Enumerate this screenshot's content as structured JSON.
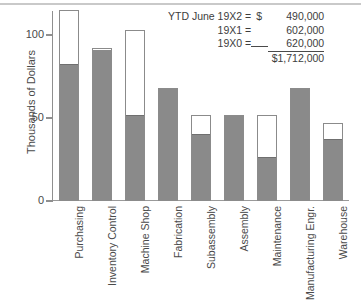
{
  "chart_data": {
    "type": "bar",
    "title": "",
    "subtitle": "",
    "xlabel": "",
    "ylabel": "Thousands of Dollars",
    "ylim": [
      0,
      115
    ],
    "yticks": [
      0,
      50,
      100
    ],
    "ytick_labels": [
      "0",
      "50",
      "100"
    ],
    "grid": false,
    "legend_position": "none",
    "orientation": "vertical",
    "stacked": true,
    "note": "Each bar shows a gray filled segment (actual) inside a white outlined segment (total/budget). Where the bar is entirely gray the two values are equal.",
    "categories": [
      "Purchasing",
      "Inventory Control",
      "Machine Shop",
      "Fabrication",
      "Subassembly",
      "Assembly",
      "Maintenance",
      "Manufacturing Engr.",
      "Warehouse"
    ],
    "series": [
      {
        "name": "Filled (gray)",
        "color": "#8a8a8a",
        "values": [
          82,
          92,
          51,
          68,
          40,
          52,
          26,
          68,
          37
        ]
      },
      {
        "name": "Outline total (white)",
        "color": "#ffffff",
        "values": [
          115,
          92,
          103,
          68,
          52,
          52,
          52,
          68,
          47
        ]
      }
    ],
    "annotations": {
      "rows": [
        {
          "label": "YTD June 19X2 =",
          "currency": "$",
          "value": "490,000"
        },
        {
          "label": "19X1 =",
          "currency": "",
          "value": "602,000"
        },
        {
          "label": "19X0 =",
          "currency": "",
          "value": "620,000"
        }
      ],
      "total": "$1,712,000"
    }
  },
  "colors": {
    "bar_fill": "#8a8a8a",
    "bar_outline": "#8b8b8b",
    "axis": "#8f8f8f",
    "text": "#4a4a4a",
    "background": "#ffffff",
    "top_rule": "#c9c9c9"
  }
}
